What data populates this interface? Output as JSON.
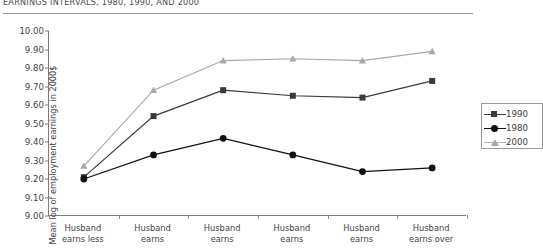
{
  "figure": {
    "title": "EARNINGS INTERVALS, 1980, 1990, AND 2000",
    "ylabel": "Mean log of employment earnings in 2000$"
  },
  "legend": {
    "position": "right",
    "entries": [
      {
        "label": "1990",
        "marker": "square-marker",
        "color": "#3a3a3a"
      },
      {
        "label": "1980",
        "marker": "circle-marker",
        "color": "#111111"
      },
      {
        "label": "2000",
        "marker": "triangle-marker",
        "color": "#a8a8a8"
      }
    ]
  },
  "axis": {
    "yticks": [
      "10.00",
      "9.90",
      "9.80",
      "9.70",
      "9.60",
      "9.50",
      "9.40",
      "9.30",
      "9.20",
      "9.10",
      "9.00"
    ],
    "xlabels": [
      "Husband\nearns less",
      "Husband\nearns",
      "Husband\nearns",
      "Husband\nearns",
      "Husband\nearns",
      "Husband\nearns over"
    ],
    "xlabel_lines": [
      [
        "Husband",
        "earns less"
      ],
      [
        "Husband",
        "earns"
      ],
      [
        "Husband",
        "earns"
      ],
      [
        "Husband",
        "earns"
      ],
      [
        "Husband",
        "earns"
      ],
      [
        "Husband",
        "earns over"
      ]
    ]
  },
  "chart_data": {
    "type": "line",
    "title": "EARNINGS INTERVALS, 1980, 1990, AND 2000",
    "xlabel": "",
    "ylabel": "Mean log of employment earnings in 2000$",
    "ylim": [
      9.0,
      10.0
    ],
    "ytick_step": 0.1,
    "grid": false,
    "legend_position": "right",
    "categories": [
      "Husband earns less",
      "Husband earns",
      "Husband earns",
      "Husband earns",
      "Husband earns",
      "Husband earns over"
    ],
    "series": [
      {
        "name": "1990",
        "marker": "square",
        "color": "#3a3a3a",
        "values": [
          9.21,
          9.54,
          9.68,
          9.65,
          9.64,
          9.73
        ]
      },
      {
        "name": "1980",
        "marker": "circle",
        "color": "#111111",
        "values": [
          9.2,
          9.33,
          9.42,
          9.33,
          9.24,
          9.26
        ]
      },
      {
        "name": "2000",
        "marker": "triangle",
        "color": "#a8a8a8",
        "values": [
          9.27,
          9.68,
          9.84,
          9.85,
          9.84,
          9.89
        ]
      }
    ]
  }
}
